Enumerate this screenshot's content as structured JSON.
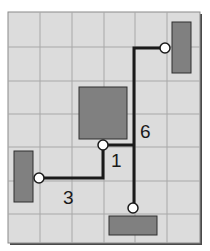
{
  "diagram": {
    "type": "wire-routing-grid",
    "colors": {
      "background": "#dcdcdc",
      "grid": "#a8a8a8",
      "frame": "#8a8a8a",
      "frame_shadow": "#4a4a4a",
      "block_fill": "#808080",
      "block_stroke": "#2e2e2e",
      "wire": "#1a1a1a",
      "node_fill": "#ffffff",
      "label": "#1a1a1a"
    },
    "blocks": [
      {
        "id": "block-top-right",
        "x": 172,
        "y": 22,
        "w": 19,
        "h": 51
      },
      {
        "id": "block-center",
        "x": 79,
        "y": 87,
        "w": 48,
        "h": 52
      },
      {
        "id": "block-left",
        "x": 14,
        "y": 151,
        "w": 19,
        "h": 51
      },
      {
        "id": "block-bottom",
        "x": 109,
        "y": 216,
        "w": 48,
        "h": 19
      }
    ],
    "nodes": [
      {
        "id": "node-top-right",
        "x": 165,
        "y": 48
      },
      {
        "id": "node-center",
        "x": 103,
        "y": 145
      },
      {
        "id": "node-left",
        "x": 39,
        "y": 178
      },
      {
        "id": "node-bottom",
        "x": 133,
        "y": 208
      }
    ],
    "labels": [
      {
        "id": "label-6",
        "text": "6",
        "x": 140,
        "y": 138
      },
      {
        "id": "label-1",
        "text": "1",
        "x": 111,
        "y": 167
      },
      {
        "id": "label-3",
        "text": "3",
        "x": 63,
        "y": 204
      }
    ]
  }
}
